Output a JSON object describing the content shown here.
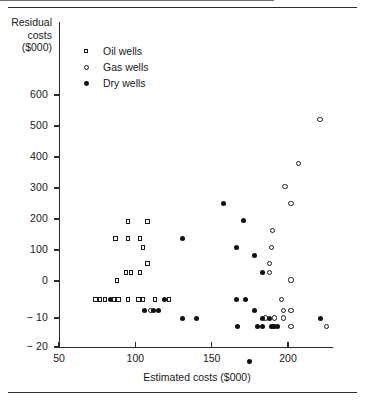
{
  "figure": {
    "top_rule": true,
    "bottom_rule": true,
    "background": "#ffffff"
  },
  "chart_data": {
    "type": "scatter",
    "title": "",
    "xlabel": "Estimated costs ($000)",
    "ylabel": "Residual costs ($000)",
    "ylabel_lines": [
      "Residual",
      "costs",
      "($000)"
    ],
    "xlim": [
      50,
      228
    ],
    "xticks": [
      50,
      100,
      150,
      200
    ],
    "xtick_labels": [
      "50",
      "100",
      "150",
      "200"
    ],
    "yticks": [
      -20,
      -10,
      0,
      100,
      200,
      300,
      400,
      500,
      600
    ],
    "ytick_labels": [
      "− 20",
      "− 10",
      "0",
      "100",
      "200",
      "300",
      "400",
      "500",
      "600"
    ],
    "y_axis_note": "broken (non-linear) scale: below zero expanded",
    "grid": false,
    "zero_line": true,
    "legend_position": "upper-left-inside",
    "legend": [
      {
        "label": "Oil wells",
        "marker": "open-square",
        "color": "#1a1a1a"
      },
      {
        "label": "Gas wells",
        "marker": "open-circle",
        "color": "#1a1a1a"
      },
      {
        "label": "Dry wells",
        "marker": "filled-circle",
        "color": "#101010"
      }
    ],
    "series": [
      {
        "name": "Oil wells",
        "marker": "open-square",
        "points": [
          [
            88,
            1
          ],
          [
            94,
            28
          ],
          [
            97,
            28
          ],
          [
            103,
            28
          ],
          [
            95,
            137
          ],
          [
            103,
            137
          ],
          [
            105,
            108
          ],
          [
            108,
            57
          ],
          [
            95,
            192
          ],
          [
            108,
            192
          ],
          [
            87,
            137
          ],
          [
            74,
            -5
          ],
          [
            77,
            -5
          ],
          [
            80,
            -5
          ],
          [
            86,
            -5
          ],
          [
            89,
            -5
          ],
          [
            95,
            -5
          ],
          [
            102,
            -5
          ],
          [
            105,
            -5
          ],
          [
            113,
            -5
          ],
          [
            122,
            -5
          ]
        ]
      },
      {
        "name": "Gas wells",
        "marker": "open-circle",
        "points": [
          [
            221,
            520
          ],
          [
            207,
            380
          ],
          [
            198,
            305
          ],
          [
            202,
            250
          ],
          [
            190,
            163
          ],
          [
            189,
            108
          ],
          [
            188,
            57
          ],
          [
            188,
            28
          ],
          [
            202,
            3
          ],
          [
            110,
            -8
          ],
          [
            196,
            -5
          ],
          [
            197,
            -8
          ],
          [
            202,
            -8
          ],
          [
            185,
            -10
          ],
          [
            191,
            -10
          ],
          [
            197,
            -10
          ],
          [
            190,
            -13
          ],
          [
            202,
            -13
          ],
          [
            225,
            -13
          ]
        ]
      },
      {
        "name": "Dry wells",
        "marker": "filled-circle",
        "points": [
          [
            158,
            250
          ],
          [
            171,
            195
          ],
          [
            131,
            137
          ],
          [
            166,
            108
          ],
          [
            178,
            82
          ],
          [
            183,
            28
          ],
          [
            175,
            -25
          ],
          [
            84,
            -5
          ],
          [
            119,
            -5
          ],
          [
            166,
            -5
          ],
          [
            172,
            -5
          ],
          [
            106,
            -8
          ],
          [
            112,
            -8
          ],
          [
            115,
            -8
          ],
          [
            178,
            -8
          ],
          [
            131,
            -10
          ],
          [
            140,
            -10
          ],
          [
            183,
            -10
          ],
          [
            188,
            -10
          ],
          [
            221,
            -10
          ],
          [
            167,
            -13
          ],
          [
            180,
            -13
          ],
          [
            183,
            -13
          ],
          [
            189,
            -13
          ],
          [
            191,
            -13
          ],
          [
            193,
            -13
          ]
        ]
      }
    ]
  }
}
